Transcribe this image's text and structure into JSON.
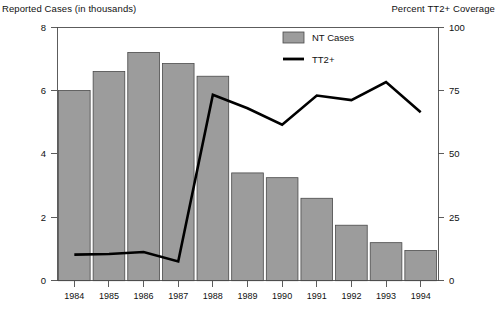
{
  "figure": {
    "left_axis_title": "Reported Cases (in thousands)",
    "right_axis_title": "Percent TT2+ Coverage"
  },
  "legend": {
    "entries": [
      {
        "label": "NT Cases",
        "marker": "bar-swatch-icon",
        "color": "#9c9c9c"
      },
      {
        "label": "TT2+",
        "marker": "line-swatch-icon",
        "color": "#000000"
      }
    ]
  },
  "axes": {
    "left_ticks": [
      "0",
      "2",
      "4",
      "6",
      "8"
    ],
    "right_ticks": [
      "0",
      "25",
      "50",
      "75",
      "100"
    ],
    "x_ticks": [
      "1984",
      "1985",
      "1986",
      "1987",
      "1988",
      "1989",
      "1990",
      "1991",
      "1992",
      "1993",
      "1994"
    ]
  },
  "chart_data": {
    "type": "bar",
    "title": "",
    "xlabel": "",
    "ylabel": "Reported Cases (in thousands)",
    "y2label": "Percent TT2+ Coverage",
    "categories": [
      "1984",
      "1985",
      "1986",
      "1987",
      "1988",
      "1989",
      "1990",
      "1991",
      "1992",
      "1993",
      "1994"
    ],
    "ylim": [
      0,
      8
    ],
    "y2lim": [
      0,
      100
    ],
    "grid": false,
    "legend_position": "top-center-right",
    "series": [
      {
        "name": "NT Cases",
        "type": "bar",
        "axis": "left",
        "units": "thousands",
        "color": "#9c9c9c",
        "values": [
          6.0,
          6.6,
          7.2,
          6.85,
          6.45,
          3.4,
          3.25,
          2.6,
          1.75,
          1.2,
          0.95
        ]
      },
      {
        "name": "TT2+",
        "type": "line",
        "axis": "right",
        "units": "percent",
        "color": "#000000",
        "values": [
          10.3,
          10.5,
          11.3,
          7.6,
          73.3,
          68.0,
          61.5,
          73.0,
          71.2,
          78.3,
          66.4
        ]
      }
    ]
  }
}
